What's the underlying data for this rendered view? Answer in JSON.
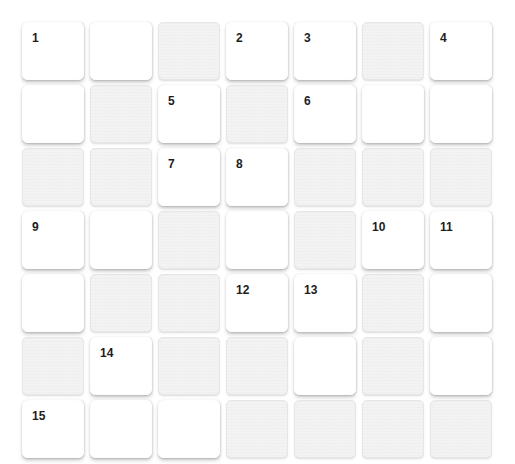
{
  "puzzle": {
    "title": "Crossword Grid",
    "rows": 7,
    "columns": 7,
    "cell_colors": {
      "open_cell": "#ffffff",
      "block_cell": "#ededed",
      "number_text": "#1d1d1d",
      "page_background": "#ffffff"
    },
    "grid": [
      [
        {
          "type": "open",
          "number": "1",
          "letter": ""
        },
        {
          "type": "open",
          "number": "",
          "letter": ""
        },
        {
          "type": "block",
          "number": "",
          "letter": ""
        },
        {
          "type": "open",
          "number": "2",
          "letter": ""
        },
        {
          "type": "open",
          "number": "3",
          "letter": ""
        },
        {
          "type": "block",
          "number": "",
          "letter": ""
        },
        {
          "type": "open",
          "number": "4",
          "letter": ""
        }
      ],
      [
        {
          "type": "open",
          "number": "",
          "letter": ""
        },
        {
          "type": "block",
          "number": "",
          "letter": ""
        },
        {
          "type": "open",
          "number": "5",
          "letter": ""
        },
        {
          "type": "block",
          "number": "",
          "letter": ""
        },
        {
          "type": "open",
          "number": "6",
          "letter": ""
        },
        {
          "type": "open",
          "number": "",
          "letter": ""
        },
        {
          "type": "open",
          "number": "",
          "letter": ""
        }
      ],
      [
        {
          "type": "block",
          "number": "",
          "letter": ""
        },
        {
          "type": "block",
          "number": "",
          "letter": ""
        },
        {
          "type": "open",
          "number": "7",
          "letter": ""
        },
        {
          "type": "open",
          "number": "8",
          "letter": ""
        },
        {
          "type": "block",
          "number": "",
          "letter": ""
        },
        {
          "type": "block",
          "number": "",
          "letter": ""
        },
        {
          "type": "block",
          "number": "",
          "letter": ""
        }
      ],
      [
        {
          "type": "open",
          "number": "9",
          "letter": ""
        },
        {
          "type": "open",
          "number": "",
          "letter": ""
        },
        {
          "type": "block",
          "number": "",
          "letter": ""
        },
        {
          "type": "open",
          "number": "",
          "letter": ""
        },
        {
          "type": "block",
          "number": "",
          "letter": ""
        },
        {
          "type": "open",
          "number": "10",
          "letter": ""
        },
        {
          "type": "open",
          "number": "11",
          "letter": ""
        }
      ],
      [
        {
          "type": "open",
          "number": "",
          "letter": ""
        },
        {
          "type": "block",
          "number": "",
          "letter": ""
        },
        {
          "type": "block",
          "number": "",
          "letter": ""
        },
        {
          "type": "open",
          "number": "12",
          "letter": ""
        },
        {
          "type": "open",
          "number": "13",
          "letter": ""
        },
        {
          "type": "block",
          "number": "",
          "letter": ""
        },
        {
          "type": "open",
          "number": "",
          "letter": ""
        }
      ],
      [
        {
          "type": "block",
          "number": "",
          "letter": ""
        },
        {
          "type": "open",
          "number": "14",
          "letter": ""
        },
        {
          "type": "block",
          "number": "",
          "letter": ""
        },
        {
          "type": "block",
          "number": "",
          "letter": ""
        },
        {
          "type": "open",
          "number": "",
          "letter": ""
        },
        {
          "type": "block",
          "number": "",
          "letter": ""
        },
        {
          "type": "open",
          "number": "",
          "letter": ""
        }
      ],
      [
        {
          "type": "open",
          "number": "15",
          "letter": ""
        },
        {
          "type": "open",
          "number": "",
          "letter": ""
        },
        {
          "type": "open",
          "number": "",
          "letter": ""
        },
        {
          "type": "block",
          "number": "",
          "letter": ""
        },
        {
          "type": "block",
          "number": "",
          "letter": ""
        },
        {
          "type": "block",
          "number": "",
          "letter": ""
        },
        {
          "type": "block",
          "number": "",
          "letter": ""
        }
      ]
    ]
  }
}
